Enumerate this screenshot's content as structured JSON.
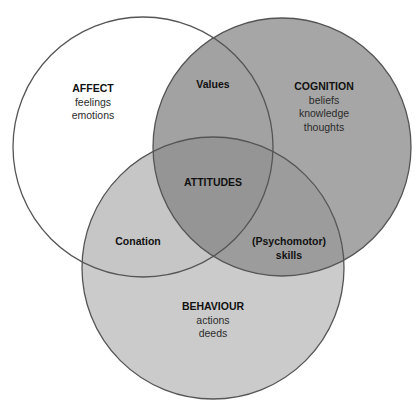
{
  "diagram": {
    "type": "venn-3",
    "circles": [
      {
        "id": "affect",
        "title": "AFFECT",
        "items": [
          "feelings",
          "emotions"
        ],
        "fill": "#ffffff"
      },
      {
        "id": "cognition",
        "title": "COGNITION",
        "items": [
          "beliefs",
          "knowledge",
          "thoughts"
        ],
        "fill": "#a6a6a6"
      },
      {
        "id": "behaviour",
        "title": "BEHAVIOUR",
        "items": [
          "actions",
          "deeds"
        ],
        "fill": "#cbcbcb"
      }
    ],
    "intersections": [
      {
        "id": "affect-cognition",
        "sets": [
          "affect",
          "cognition"
        ],
        "label": "Values",
        "fill": "#a2a2a2"
      },
      {
        "id": "affect-behaviour",
        "sets": [
          "affect",
          "behaviour"
        ],
        "label": "Conation",
        "fill": "#c6c6c6"
      },
      {
        "id": "cognition-behaviour",
        "sets": [
          "cognition",
          "behaviour"
        ],
        "label": "(Psychomotor)\nskills",
        "label_lines": [
          "(Psychomotor)",
          "skills"
        ],
        "fill": "#9c9c9c"
      },
      {
        "id": "all",
        "sets": [
          "affect",
          "cognition",
          "behaviour"
        ],
        "label": "ATTITUDES",
        "fill": "#959595"
      }
    ],
    "stroke_color": "#555555"
  }
}
